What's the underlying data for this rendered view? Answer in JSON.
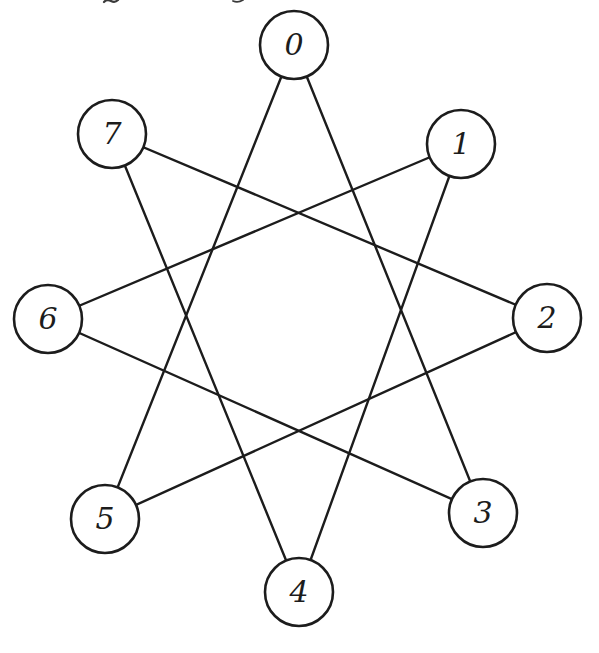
{
  "figure": {
    "background_color": "#ffffff",
    "ink_color": "#1c1c1c",
    "node_fill": "#ffffff",
    "node_radius": 34,
    "node_stroke_width": 2.6,
    "edge_stroke_width": 2.4,
    "canvas_width": 599,
    "canvas_height": 653,
    "nodes": [
      {
        "id": "0",
        "label": "0",
        "x": 294,
        "y": 45
      },
      {
        "id": "1",
        "label": "1",
        "x": 461,
        "y": 144
      },
      {
        "id": "2",
        "label": "2",
        "x": 547,
        "y": 318
      },
      {
        "id": "3",
        "label": "3",
        "x": 483,
        "y": 513
      },
      {
        "id": "4",
        "label": "4",
        "x": 299,
        "y": 592
      },
      {
        "id": "5",
        "label": "5",
        "x": 105,
        "y": 519
      },
      {
        "id": "6",
        "label": "6",
        "x": 48,
        "y": 319
      },
      {
        "id": "7",
        "label": "7",
        "x": 112,
        "y": 134
      }
    ],
    "edges": [
      [
        "0",
        "3"
      ],
      [
        "0",
        "5"
      ],
      [
        "1",
        "4"
      ],
      [
        "1",
        "6"
      ],
      [
        "2",
        "5"
      ],
      [
        "2",
        "7"
      ],
      [
        "3",
        "6"
      ],
      [
        "4",
        "7"
      ]
    ]
  },
  "artifacts": {
    "color": "#3a3a3a",
    "marks": [
      {
        "kind": "squiggle",
        "x": 104,
        "y": 2,
        "w": 14
      },
      {
        "kind": "dot",
        "x": 205,
        "y": 2,
        "w": 3
      },
      {
        "kind": "tick",
        "x": 233,
        "y": 1,
        "w": 10
      },
      {
        "kind": "dot",
        "x": 311,
        "y": 171,
        "w": 2
      }
    ]
  }
}
